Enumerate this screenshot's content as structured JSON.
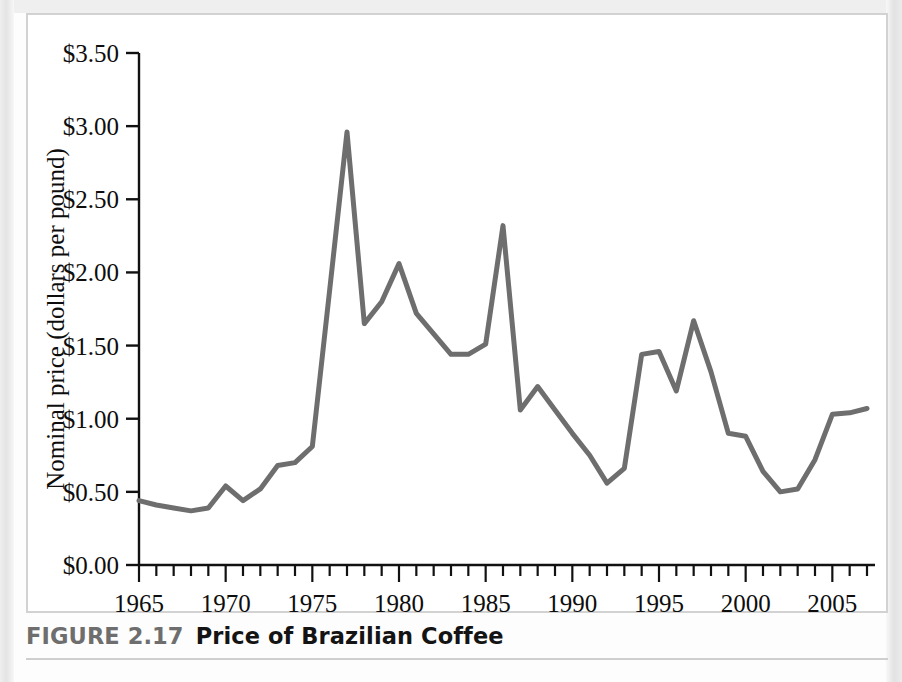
{
  "figure": {
    "number_label": "FIGURE 2.17",
    "title": "Price of Brazilian Coffee"
  },
  "chart_data": {
    "type": "line",
    "title": "Price of Brazilian Coffee",
    "xlabel": "",
    "ylabel": "Nominal price (dollars per pound)",
    "xlim": [
      1965,
      2007
    ],
    "ylim": [
      0.0,
      3.5
    ],
    "grid": false,
    "legend": null,
    "line_color": "#6e6e6e",
    "line_width": 5,
    "y_tick_labels": [
      "$0.00",
      "$0.50",
      "$1.00",
      "$1.50",
      "$2.00",
      "$2.50",
      "$3.00",
      "$3.50"
    ],
    "y_tick_values": [
      0.0,
      0.5,
      1.0,
      1.5,
      2.0,
      2.5,
      3.0,
      3.5
    ],
    "x_tick_labels": [
      "1965",
      "1970",
      "1975",
      "1980",
      "1985",
      "1990",
      "1995",
      "2000",
      "2005"
    ],
    "x_major_tick_values": [
      1965,
      1970,
      1975,
      1980,
      1985,
      1990,
      1995,
      2000,
      2005
    ],
    "x_minor_tick_step": 1,
    "x": [
      1965,
      1966,
      1967,
      1968,
      1969,
      1970,
      1971,
      1972,
      1973,
      1974,
      1975,
      1976,
      1977,
      1978,
      1979,
      1980,
      1981,
      1982,
      1983,
      1984,
      1985,
      1986,
      1987,
      1988,
      1989,
      1990,
      1991,
      1992,
      1993,
      1994,
      1995,
      1996,
      1997,
      1998,
      1999,
      2000,
      2001,
      2002,
      2003,
      2004,
      2005,
      2006,
      2007
    ],
    "values": [
      0.44,
      0.41,
      0.39,
      0.37,
      0.39,
      0.54,
      0.44,
      0.52,
      0.68,
      0.7,
      0.81,
      1.88,
      2.96,
      1.65,
      1.8,
      2.06,
      1.72,
      1.58,
      1.44,
      1.44,
      1.51,
      2.32,
      1.06,
      1.22,
      1.06,
      0.9,
      0.75,
      0.56,
      0.66,
      1.44,
      1.46,
      1.19,
      1.67,
      1.32,
      0.9,
      0.88,
      0.64,
      0.5,
      0.52,
      0.72,
      1.03,
      1.04,
      1.07
    ]
  }
}
